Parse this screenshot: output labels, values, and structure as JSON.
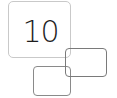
{
  "icon": {
    "number": "10",
    "colors": {
      "square_border": "#c9c9c9",
      "number_text": "#1e1e1e",
      "rect_right_border": "#7a7a7a",
      "rect_left_border": "#8a8a8a"
    }
  }
}
